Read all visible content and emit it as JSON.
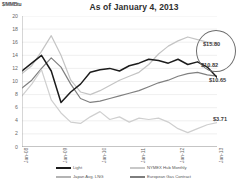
{
  "header": {
    "title": "As of January 4, 2013",
    "unit_label": "$/MMBtu"
  },
  "callouts": [
    {
      "name": "japan-lng-value",
      "text": "$15.80"
    },
    {
      "name": "european-gas-value",
      "text": "$10.82"
    },
    {
      "name": "light-value",
      "text": "$10.65"
    },
    {
      "name": "nymex-hub-value",
      "text": "$3.71"
    }
  ],
  "legend": {
    "position": "bottom",
    "items": [
      {
        "label": "Light",
        "color": "#1c1c1c"
      },
      {
        "label": "NYMEX Hub Monthly",
        "color": "#c8c8c8"
      },
      {
        "label": "Japan Avg. LNG",
        "color": "#b4b4b4"
      },
      {
        "label": "European Gas Contract",
        "color": "#7d7d7d"
      }
    ]
  },
  "chart_data": {
    "type": "line",
    "title": "As of January 4, 2013",
    "xlabel": "",
    "ylabel": "$/MMBtu",
    "ylim": [
      0,
      20
    ],
    "yticks": [
      0,
      2,
      4,
      6,
      8,
      10,
      12,
      14,
      16,
      18,
      20
    ],
    "xticks": [
      "Jan-08",
      "Jan-09",
      "Jan-10",
      "Jan-11",
      "Jan-12",
      "Jan-13"
    ],
    "grid": true,
    "x": [
      "Jan-08",
      "Apr-08",
      "Jul-08",
      "Oct-08",
      "Jan-09",
      "Apr-09",
      "Jul-09",
      "Oct-09",
      "Jan-10",
      "Apr-10",
      "Jul-10",
      "Oct-10",
      "Jan-11",
      "Apr-11",
      "Jul-11",
      "Oct-11",
      "Jan-12",
      "Apr-12",
      "Jul-12",
      "Oct-12",
      "Jan-13"
    ],
    "series": [
      {
        "name": "Japan Avg. LNG",
        "color": "#c4c4c4",
        "end_value": 15.8,
        "values": [
          11.2,
          12.4,
          14.6,
          17.0,
          14.0,
          10.2,
          8.4,
          8.0,
          8.6,
          9.4,
          10.2,
          10.8,
          11.4,
          12.6,
          14.2,
          15.4,
          16.2,
          16.8,
          16.4,
          16.0,
          15.8
        ]
      },
      {
        "name": "European Gas Contract",
        "color": "#808080",
        "end_value": 10.82,
        "values": [
          9.0,
          10.2,
          12.0,
          13.6,
          12.2,
          9.6,
          7.4,
          6.8,
          7.0,
          7.4,
          7.8,
          8.2,
          8.6,
          9.2,
          9.8,
          10.2,
          10.8,
          11.2,
          11.4,
          11.0,
          10.82
        ]
      },
      {
        "name": "Light",
        "color": "#1c1c1c",
        "end_value": 10.65,
        "values": [
          11.6,
          12.8,
          14.0,
          11.6,
          6.8,
          8.4,
          9.6,
          11.4,
          11.8,
          12.0,
          11.6,
          12.4,
          12.8,
          13.4,
          13.2,
          12.8,
          13.4,
          12.6,
          13.0,
          12.2,
          10.65
        ]
      },
      {
        "name": "NYMEX Hub Monthly",
        "color": "#cfcfcf",
        "end_value": 3.71,
        "values": [
          7.8,
          9.6,
          11.8,
          7.2,
          5.2,
          3.8,
          3.6,
          4.6,
          5.4,
          4.2,
          4.6,
          3.8,
          4.4,
          4.2,
          4.4,
          3.8,
          2.8,
          2.2,
          2.8,
          3.4,
          3.71
        ]
      }
    ]
  }
}
